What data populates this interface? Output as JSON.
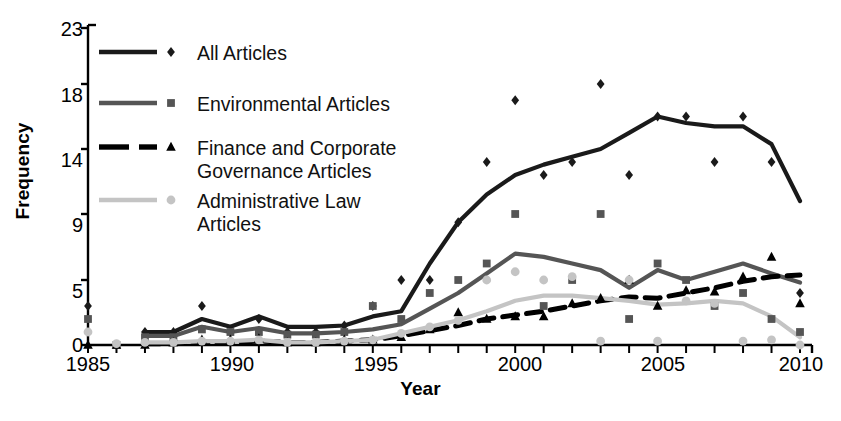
{
  "chart_data": {
    "type": "line",
    "title": "",
    "xlabel": "Year",
    "ylabel": "Frequency",
    "xlim": [
      1985,
      2010
    ],
    "ylim": [
      0,
      23
    ],
    "grid": false,
    "legend_position": "top-left-inside",
    "x_ticks_labeled": [
      "1985",
      "1990",
      "1995",
      "2000",
      "2005",
      "2010"
    ],
    "x_ticks_all": [
      1985,
      1986,
      1987,
      1988,
      1989,
      1990,
      1991,
      1992,
      1993,
      1994,
      1995,
      1996,
      1997,
      1998,
      1999,
      2000,
      2001,
      2002,
      2003,
      2004,
      2005,
      2006,
      2007,
      2008,
      2009,
      2010
    ],
    "y_ticks": [
      0,
      5,
      9,
      14,
      18,
      23
    ],
    "x": [
      1985,
      1986,
      1987,
      1988,
      1989,
      1990,
      1991,
      1992,
      1993,
      1994,
      1995,
      1996,
      1997,
      1998,
      1999,
      2000,
      2001,
      2002,
      2003,
      2004,
      2005,
      2006,
      2007,
      2008,
      2009,
      2010
    ],
    "series": [
      {
        "name": "All Articles",
        "color": "#1a1a1a",
        "marker": "diamond",
        "dash": "solid",
        "width": 4.2,
        "line_start_year": 1987,
        "values": [
          null,
          null,
          1,
          1,
          2,
          1.4,
          2.2,
          1.4,
          1.4,
          1.5,
          2.2,
          2.6,
          6,
          8.5,
          10.5,
          12,
          12.8,
          13.4,
          14,
          15,
          16,
          15.6,
          15.4,
          15.4,
          14.3,
          10
        ],
        "scatter": [
          3,
          0,
          1,
          1,
          3,
          1,
          2,
          1,
          1,
          1.5,
          3,
          5,
          5,
          8.5,
          13,
          17,
          12,
          13,
          18,
          12,
          16,
          16,
          13,
          16,
          13,
          4
        ]
      },
      {
        "name": "Environmental Articles",
        "color": "#555555",
        "marker": "square",
        "dash": "solid",
        "width": 4.2,
        "line_start_year": 1987,
        "values": [
          null,
          null,
          0.7,
          0.7,
          1.4,
          1.0,
          1.3,
          0.9,
          0.9,
          1.0,
          1.2,
          1.6,
          2.8,
          4.0,
          5.4,
          6.6,
          6.4,
          6.0,
          5.6,
          4.4,
          5.6,
          5.0,
          5.5,
          6.0,
          5.4,
          4.8
        ],
        "scatter": [
          2,
          0,
          0.6,
          0.6,
          1.2,
          1.0,
          1.0,
          0.8,
          0.8,
          1.0,
          3,
          2,
          4,
          5,
          6,
          9,
          3,
          5,
          9,
          2,
          6,
          5,
          3,
          4,
          2,
          1
        ]
      },
      {
        "name": "Finance and Corporate\nGovernance Articles",
        "color": "#000000",
        "marker": "triangle",
        "dash": "dashed",
        "width": 5.0,
        "line_start_year": 1987,
        "values": [
          null,
          null,
          0.1,
          0.1,
          0.2,
          0.2,
          0.3,
          0.2,
          0.2,
          0.3,
          0.4,
          0.7,
          1.1,
          1.5,
          2.0,
          2.3,
          2.6,
          3.0,
          3.4,
          3.7,
          3.6,
          4.0,
          4.4,
          4.9,
          5.2,
          5.3
        ],
        "scatter": [
          0,
          0,
          0,
          0.2,
          0.4,
          0.4,
          0.5,
          0.2,
          0.2,
          0.4,
          0.4,
          0.6,
          1.2,
          2.5,
          2.0,
          2.2,
          2.2,
          3.2,
          3.6,
          5.0,
          3.0,
          4.2,
          4.1,
          5.2,
          6.4,
          3.2
        ]
      },
      {
        "name": "Administrative Law\nArticles",
        "color": "#c4c4c4",
        "marker": "circle",
        "dash": "solid",
        "width": 4.2,
        "line_start_year": 1987,
        "values": [
          null,
          null,
          0.2,
          0.2,
          0.3,
          0.3,
          0.4,
          0.2,
          0.2,
          0.3,
          0.4,
          0.9,
          1.4,
          1.9,
          2.6,
          3.4,
          3.8,
          3.8,
          3.6,
          3.4,
          3.1,
          3.2,
          3.4,
          3.2,
          2.2,
          0.6
        ],
        "scatter": [
          1,
          0.1,
          0.2,
          0.2,
          0.3,
          0.3,
          0.4,
          0.2,
          0.2,
          0.3,
          0.4,
          0.9,
          1.4,
          1.9,
          5.0,
          5.5,
          5.0,
          5.2,
          0.3,
          5.0,
          0.3,
          3.4,
          3.2,
          0.3,
          0.4,
          0.0
        ]
      }
    ]
  },
  "legend": {
    "items": [
      {
        "label": "All Articles",
        "label2": "",
        "swatch_color": "#1a1a1a",
        "marker": "diamond",
        "dash": "solid"
      },
      {
        "label": "Environmental Articles",
        "label2": "",
        "swatch_color": "#555555",
        "marker": "square",
        "dash": "solid"
      },
      {
        "label": "Finance and Corporate",
        "label2": "Governance Articles",
        "swatch_color": "#000000",
        "marker": "triangle",
        "dash": "dashed"
      },
      {
        "label": "Administrative Law",
        "label2": "Articles",
        "swatch_color": "#c4c4c4",
        "marker": "circle",
        "dash": "solid"
      }
    ]
  },
  "axes": {
    "y_title": "Frequency",
    "x_title": "Year",
    "y_tick_labels": [
      "23",
      "18",
      "14",
      "9",
      "5",
      "0"
    ],
    "x_tick_labels": [
      "1985",
      "1990",
      "1995",
      "2000",
      "2005",
      "2010"
    ]
  }
}
